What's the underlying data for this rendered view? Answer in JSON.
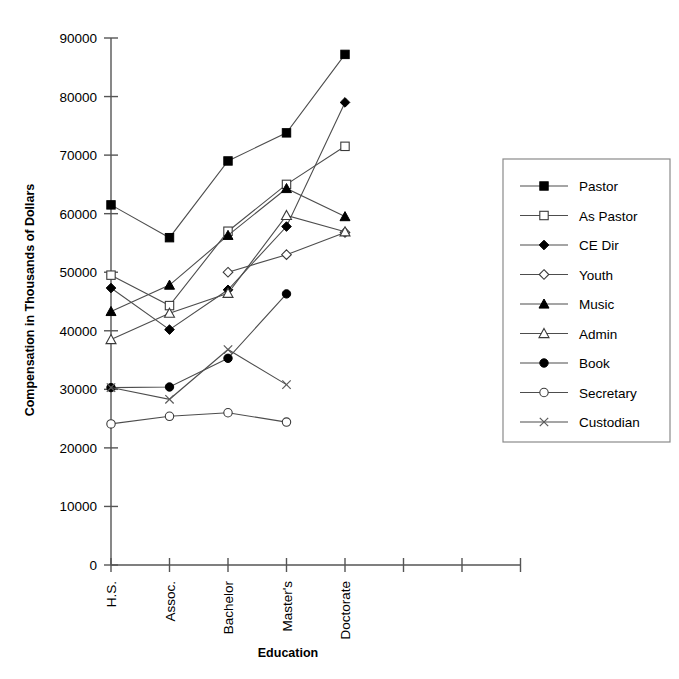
{
  "chart_data": {
    "type": "line",
    "title": "",
    "xlabel": "Education",
    "ylabel": "Compensation in Thousands of Dollars",
    "categories": [
      "H.S.",
      "Assoc.",
      "Bachelor",
      "Master's",
      "Doctorate"
    ],
    "extra_unlabeled_ticks": 2,
    "ylim": [
      0,
      90000
    ],
    "yticks": [
      0,
      10000,
      20000,
      30000,
      40000,
      50000,
      60000,
      70000,
      80000,
      90000
    ],
    "ytick_labels": [
      "0",
      "10000",
      "20000",
      "30000",
      "40000",
      "50000",
      "60000",
      "70000",
      "80000",
      "90000"
    ],
    "grid": false,
    "legend_position": "right",
    "series": [
      {
        "name": "Pastor",
        "marker": "filled-square",
        "values": [
          61500,
          55900,
          69000,
          73800,
          87200
        ]
      },
      {
        "name": "As Pastor",
        "marker": "open-square",
        "values": [
          49500,
          44300,
          57000,
          65000,
          71500
        ]
      },
      {
        "name": "CE Dir",
        "marker": "filled-diamond",
        "values": [
          47300,
          40200,
          47000,
          57800,
          79000
        ]
      },
      {
        "name": "Youth",
        "marker": "open-diamond",
        "values": [
          null,
          null,
          50000,
          53000,
          56800
        ]
      },
      {
        "name": "Music",
        "marker": "filled-triangle",
        "values": [
          43300,
          47800,
          56300,
          64300,
          59500
        ]
      },
      {
        "name": "Admin",
        "marker": "open-triangle",
        "values": [
          38500,
          43000,
          46400,
          59700,
          56900
        ]
      },
      {
        "name": "Book",
        "marker": "filled-circle",
        "values": [
          30300,
          30400,
          35300,
          46300,
          null
        ]
      },
      {
        "name": "Secretary",
        "marker": "open-circle",
        "values": [
          24100,
          25400,
          26000,
          24400,
          null
        ]
      },
      {
        "name": "Custodian",
        "marker": "cross",
        "values": [
          30300,
          28300,
          36800,
          30800,
          null
        ]
      }
    ]
  },
  "legend": {
    "items": [
      {
        "label": "Pastor",
        "marker": "filled-square"
      },
      {
        "label": "As Pastor",
        "marker": "open-square"
      },
      {
        "label": "CE Dir",
        "marker": "filled-diamond"
      },
      {
        "label": "Youth",
        "marker": "open-diamond"
      },
      {
        "label": "Music",
        "marker": "filled-triangle"
      },
      {
        "label": "Admin",
        "marker": "open-triangle"
      },
      {
        "label": "Book",
        "marker": "filled-circle"
      },
      {
        "label": "Secretary",
        "marker": "open-circle"
      },
      {
        "label": "Custodian",
        "marker": "cross"
      }
    ]
  },
  "colors": {
    "line": "#4d4d4d",
    "axis": "#555555",
    "marker_fill": "#000000",
    "marker_open_fill": "#ffffff",
    "legend_border": "#8a8a8a",
    "text": "#000000",
    "background": "#ffffff"
  }
}
